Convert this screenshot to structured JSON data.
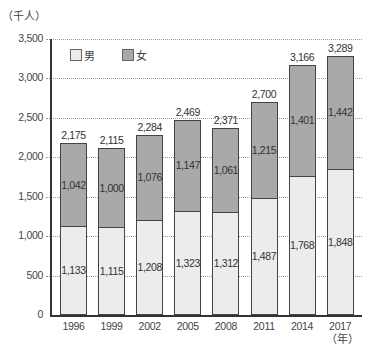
{
  "chart_data": {
    "type": "bar",
    "stacked": true,
    "title": "",
    "xlabel": "（年）",
    "ylabel": "（千人）",
    "ylim": [
      0,
      3500
    ],
    "yticks": [
      0,
      500,
      1000,
      1500,
      2000,
      2500,
      3000,
      3500
    ],
    "ytick_labels": [
      "0",
      "500",
      "1,000",
      "1,500",
      "2,000",
      "2,500",
      "3,000",
      "3,500"
    ],
    "categories": [
      "1996",
      "1999",
      "2002",
      "2005",
      "2008",
      "2011",
      "2014",
      "2017"
    ],
    "series": [
      {
        "name": "男",
        "color": "#ececec",
        "values": [
          1133,
          1115,
          1208,
          1323,
          1312,
          1487,
          1768,
          1848
        ],
        "labels": [
          "1,133",
          "1,115",
          "1,208",
          "1,323",
          "1,312",
          "1,487",
          "1,768",
          "1,848"
        ]
      },
      {
        "name": "女",
        "color": "#a9a9a9",
        "values": [
          1042,
          1000,
          1076,
          1147,
          1061,
          1215,
          1401,
          1442
        ],
        "labels": [
          "1,042",
          "1,000",
          "1,076",
          "1,147",
          "1,061",
          "1,215",
          "1,401",
          "1,442"
        ]
      }
    ],
    "totals": [
      2175,
      2115,
      2284,
      2469,
      2371,
      2700,
      3166,
      3289
    ],
    "total_labels": [
      "2,175",
      "2,115",
      "2,284",
      "2,469",
      "2,371",
      "2,700",
      "3,166",
      "3,289"
    ],
    "legend": {
      "position": "top-left",
      "entries": [
        "男",
        "女"
      ]
    },
    "grid": true
  },
  "labels": {
    "y_unit": "（千人）",
    "x_unit": "（年）"
  }
}
